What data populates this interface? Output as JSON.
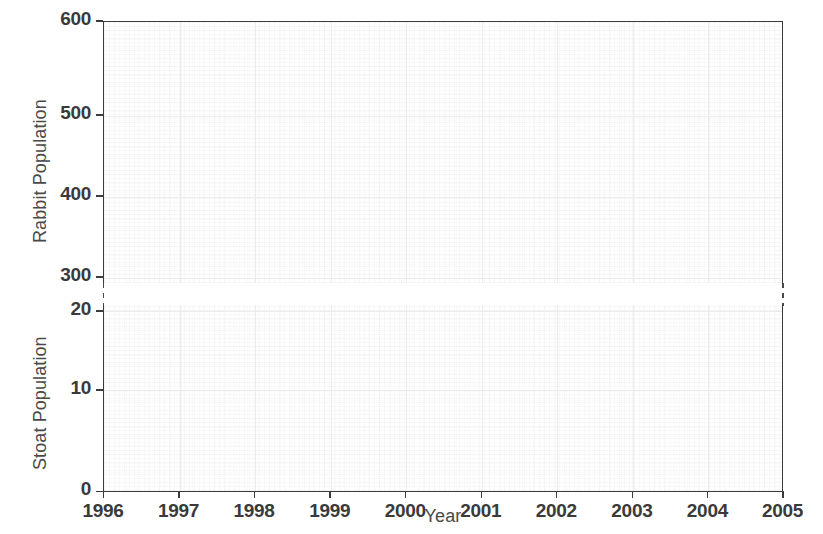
{
  "chart_data": {
    "type": "line",
    "title": "",
    "subtitle": "",
    "broken_axis": true,
    "grid": true,
    "legend": "none",
    "annotations": [],
    "xlabel": "Year",
    "x": [
      1996,
      1997,
      1998,
      1999,
      2000,
      2001,
      2002,
      2003,
      2004,
      2005
    ],
    "xticklabels": [
      "1996",
      "1997",
      "1998",
      "1999",
      "2000",
      "2001",
      "2002",
      "2003",
      "2004",
      "2005"
    ],
    "xlim": [
      1996,
      2005
    ],
    "panels": [
      {
        "name": "rabbit-panel",
        "ylabel": "Rabbit Population",
        "ylim": [
          300,
          600
        ],
        "yticks": [
          300,
          400,
          500,
          600
        ],
        "yticklabels": [
          "300",
          "400",
          "500",
          "600"
        ],
        "series": [
          {
            "name": "Rabbit Population",
            "values": []
          }
        ]
      },
      {
        "name": "stoat-panel",
        "ylabel": "Stoat Population",
        "ylim": [
          0,
          20
        ],
        "yticks": [
          0,
          10,
          20
        ],
        "yticklabels": [
          "0",
          "10",
          "20"
        ],
        "series": [
          {
            "name": "Stoat Population",
            "values": []
          }
        ]
      }
    ]
  },
  "colors": {
    "axis": "#3b3b3b",
    "text": "#3a3a3a",
    "axis_title": "#4a4a4a",
    "grid": "#ececec",
    "background": "#ffffff"
  }
}
